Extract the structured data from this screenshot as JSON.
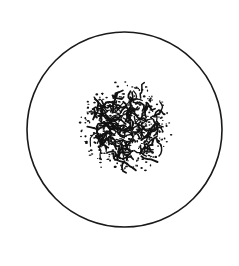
{
  "figure": {
    "width": 239,
    "height": 266,
    "background": "#ffffff",
    "outer_circle": {
      "cx": 124.5,
      "cy": 129.5,
      "r": 97.5,
      "stroke": "#1a1a1a",
      "stroke_width": 1.6
    },
    "inner_blob": {
      "cx": 125,
      "cy": 128,
      "r": 47,
      "dense_core_r": 34,
      "color": "#111111",
      "style": "stippled"
    }
  }
}
